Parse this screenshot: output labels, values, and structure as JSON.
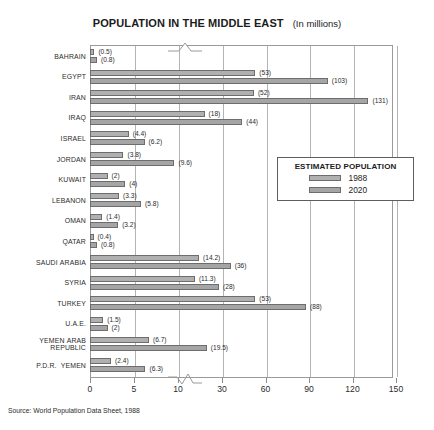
{
  "header": {
    "title": "POPULATION IN THE MIDDLE EAST",
    "subtitle": "(In millions)"
  },
  "legend": {
    "title": "ESTIMATED POPULATION",
    "items": [
      {
        "label": "1988",
        "color": "#b0b0b0"
      },
      {
        "label": "2020",
        "color": "#a5a5a5"
      }
    ]
  },
  "source": {
    "text": "Source: World Population Data Sheet, 1988"
  },
  "axis": {
    "ticks": [
      "0",
      "5",
      "10",
      "30",
      "60",
      "90",
      "120",
      "150"
    ],
    "break_between": [
      "10",
      "30"
    ]
  },
  "chart_data": {
    "type": "bar",
    "orientation": "horizontal",
    "title": "POPULATION IN THE MIDDLE EAST",
    "subtitle": "(In millions)",
    "xlabel": "",
    "ylabel": "",
    "grid": true,
    "legend_position": "inside-right",
    "xticks": [
      0,
      5,
      10,
      30,
      60,
      90,
      120,
      150
    ],
    "axis_break": [
      10,
      30
    ],
    "categories": [
      "BAHRAIN",
      "EGYPT",
      "IRAN",
      "IRAQ",
      "ISRAEL",
      "JORDAN",
      "KUWAIT",
      "LEBANON",
      "OMAN",
      "QATAR",
      "SAUDI ARABIA",
      "SYRIA",
      "TURKEY",
      "U.A.E.",
      "YEMEN ARAB REPUBLIC",
      "P.D.R. YEMEN"
    ],
    "series": [
      {
        "name": "1988",
        "values": [
          0.5,
          53,
          52,
          18,
          4.4,
          3.8,
          2,
          3.3,
          1.4,
          0.4,
          14.2,
          11.3,
          53,
          1.5,
          6.7,
          2.4
        ],
        "labels": [
          "(0.5)",
          "(53)",
          "(52)",
          "(18)",
          "(4.4)",
          "(3.8)",
          "(2)",
          "(3.3)",
          "(1.4)",
          "(0.4)",
          "(14.2)",
          "(11.3)",
          "(53)",
          "(1.5)",
          "(6.7)",
          "(2.4)"
        ]
      },
      {
        "name": "2020",
        "values": [
          0.8,
          103,
          131,
          44,
          6.2,
          9.6,
          4,
          5.8,
          3.2,
          0.8,
          36,
          28,
          88,
          2,
          19.5,
          6.3
        ],
        "labels": [
          "(0.8)",
          "(103)",
          "(131)",
          "(44)",
          "(6.2)",
          "(9.6)",
          "(4)",
          "(5.8)",
          "(3.2)",
          "(0.8)",
          "(36)",
          "(28)",
          "(88)",
          "(2)",
          "(19.5)",
          "(6.3)"
        ]
      }
    ],
    "category_display": [
      {
        "name": "BAHRAIN",
        "lines": [
          "BAHRAIN"
        ]
      },
      {
        "name": "EGYPT",
        "lines": [
          "EGYPT"
        ]
      },
      {
        "name": "IRAN",
        "lines": [
          "IRAN"
        ]
      },
      {
        "name": "IRAQ",
        "lines": [
          "IRAQ"
        ]
      },
      {
        "name": "ISRAEL",
        "lines": [
          "ISRAEL"
        ]
      },
      {
        "name": "JORDAN",
        "lines": [
          "JORDAN"
        ]
      },
      {
        "name": "KUWAIT",
        "lines": [
          "KUWAIT"
        ]
      },
      {
        "name": "LEBANON",
        "lines": [
          "LEBANON"
        ]
      },
      {
        "name": "OMAN",
        "lines": [
          "OMAN"
        ]
      },
      {
        "name": "QATAR",
        "lines": [
          "QATAR"
        ]
      },
      {
        "name": "SAUDI ARABIA",
        "lines": [
          "SAUDI ARABIA"
        ]
      },
      {
        "name": "SYRIA",
        "lines": [
          "SYRIA"
        ]
      },
      {
        "name": "TURKEY",
        "lines": [
          "TURKEY"
        ]
      },
      {
        "name": "U.A.E.",
        "lines": [
          "U.A.E."
        ]
      },
      {
        "name": "YEMEN ARAB REPUBLIC",
        "lines": [
          "YEMEN ARAB",
          "REPUBLIC"
        ]
      },
      {
        "name": "P.D.R. YEMEN",
        "lines": [
          "P.D.R.  YEMEN"
        ]
      }
    ]
  }
}
